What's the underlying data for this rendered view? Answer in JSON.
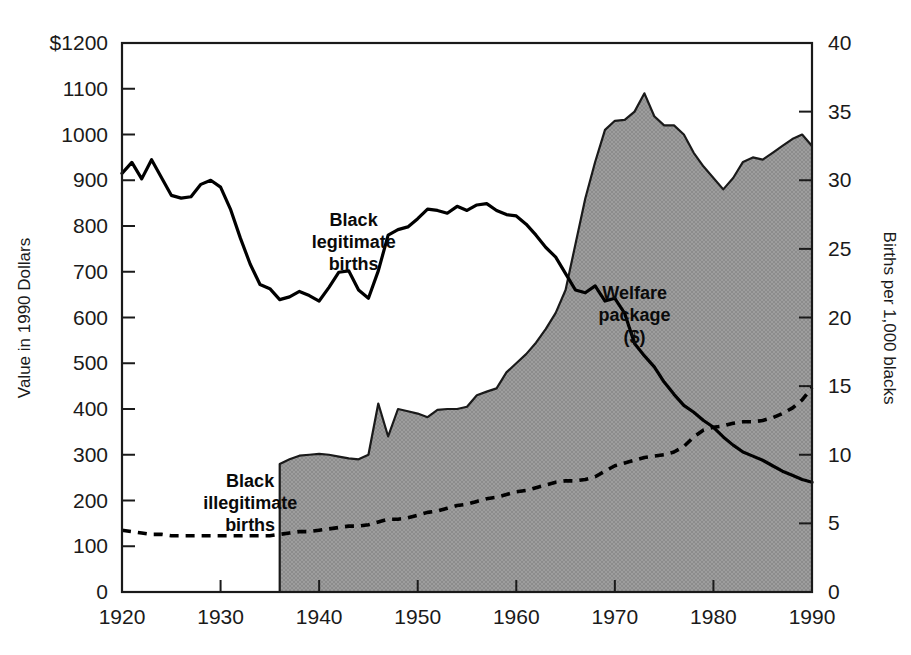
{
  "chart_data": {
    "type": "area",
    "title": "",
    "subtitle": "",
    "xlabel": "",
    "ylabel": "Value in 1990 Dollars",
    "y2label": "Births per 1,000 blacks",
    "xlim": [
      1920,
      1990
    ],
    "ylim": [
      0,
      1200
    ],
    "y2lim": [
      0,
      40
    ],
    "grid": false,
    "legend_position": "inline-annotations",
    "x_ticks": [
      1920,
      1930,
      1940,
      1950,
      1960,
      1970,
      1980,
      1990
    ],
    "x_tick_labels": [
      "1920",
      "1930",
      "1940",
      "1950",
      "1960",
      "1970",
      "1980",
      "1990"
    ],
    "y_ticks": [
      0,
      100,
      200,
      300,
      400,
      500,
      600,
      700,
      800,
      900,
      1000,
      1100,
      1200
    ],
    "y_tick_labels": [
      "0",
      "100",
      "200",
      "300",
      "400",
      "500",
      "600",
      "700",
      "800",
      "900",
      "1000",
      "1100",
      "$1200"
    ],
    "y2_ticks": [
      0,
      5,
      10,
      15,
      20,
      25,
      30,
      35,
      40
    ],
    "y2_tick_labels": [
      "0",
      "5",
      "10",
      "15",
      "20",
      "25",
      "30",
      "35",
      "40"
    ],
    "annotations": [
      {
        "name": "black-legitimate-births",
        "lines": [
          "Black",
          "legitimate",
          "births"
        ],
        "x": 1943.5,
        "y_axis": "left",
        "y": 800
      },
      {
        "name": "black-illegitimate-births",
        "lines": [
          "Black",
          "illegitimate",
          "births"
        ],
        "x": 1933.0,
        "y_axis": "left",
        "y": 230
      },
      {
        "name": "welfare-package",
        "lines": [
          "Welfare",
          "package",
          "($)"
        ],
        "x": 1972.0,
        "y_axis": "left",
        "y": 640
      }
    ],
    "series": [
      {
        "name": "Welfare package ($)",
        "key": "welfare_package",
        "axis": "left",
        "style": "area",
        "fill_color": "#9a9a9a",
        "line_color": "#1a1a1a",
        "x": [
          1936,
          1936,
          1937,
          1938,
          1939,
          1940,
          1941,
          1942,
          1943,
          1944,
          1945,
          1946,
          1947,
          1948,
          1949,
          1950,
          1951,
          1952,
          1953,
          1954,
          1955,
          1956,
          1957,
          1958,
          1959,
          1960,
          1961,
          1962,
          1963,
          1964,
          1965,
          1966,
          1967,
          1968,
          1969,
          1970,
          1971,
          1972,
          1973,
          1974,
          1975,
          1976,
          1977,
          1978,
          1979,
          1980,
          1981,
          1982,
          1983,
          1984,
          1985,
          1986,
          1987,
          1988,
          1989,
          1990
        ],
        "values": [
          0,
          280,
          290,
          298,
          300,
          302,
          300,
          296,
          292,
          290,
          300,
          412,
          340,
          400,
          395,
          390,
          382,
          398,
          400,
          400,
          405,
          430,
          438,
          445,
          480,
          500,
          520,
          545,
          575,
          610,
          660,
          760,
          860,
          940,
          1010,
          1030,
          1032,
          1050,
          1090,
          1040,
          1020,
          1020,
          1000,
          960,
          930,
          905,
          880,
          905,
          940,
          950,
          945,
          960,
          975,
          990,
          1000,
          975
        ]
      },
      {
        "name": "Black legitimate births",
        "key": "black_legitimate_births",
        "axis": "right",
        "style": "solid-line",
        "line_color": "#000000",
        "x": [
          1920,
          1921,
          1922,
          1923,
          1924,
          1925,
          1926,
          1927,
          1928,
          1929,
          1930,
          1931,
          1932,
          1933,
          1934,
          1935,
          1936,
          1937,
          1938,
          1939,
          1940,
          1941,
          1942,
          1943,
          1944,
          1945,
          1946,
          1947,
          1948,
          1949,
          1950,
          1951,
          1952,
          1953,
          1954,
          1955,
          1956,
          1957,
          1958,
          1959,
          1960,
          1961,
          1962,
          1963,
          1964,
          1965,
          1966,
          1967,
          1968,
          1969,
          1970,
          1971,
          1972,
          1973,
          1974,
          1975,
          1976,
          1977,
          1978,
          1979,
          1980,
          1981,
          1982,
          1983,
          1984,
          1985,
          1986,
          1987,
          1988,
          1989,
          1990
        ],
        "values": [
          30.5,
          31.3,
          30.1,
          31.5,
          30.2,
          28.9,
          28.7,
          28.8,
          29.7,
          30.0,
          29.5,
          27.9,
          25.8,
          23.9,
          22.4,
          22.1,
          21.3,
          21.5,
          21.9,
          21.6,
          21.2,
          22.2,
          23.3,
          23.4,
          22.0,
          21.4,
          23.4,
          26.0,
          26.4,
          26.6,
          27.2,
          27.9,
          27.8,
          27.6,
          28.1,
          27.8,
          28.2,
          28.3,
          27.8,
          27.5,
          27.4,
          26.8,
          26.0,
          25.1,
          24.4,
          23.2,
          22.0,
          21.8,
          22.3,
          21.2,
          21.4,
          20.3,
          18.1,
          17.2,
          16.4,
          15.3,
          14.4,
          13.6,
          13.1,
          12.5,
          12.0,
          11.3,
          10.7,
          10.2,
          9.9,
          9.6,
          9.2,
          8.8,
          8.5,
          8.2,
          8.0
        ]
      },
      {
        "name": "Black illegitimate births",
        "key": "black_illegitimate_births",
        "axis": "right",
        "style": "dashed-line",
        "line_color": "#000000",
        "x": [
          1920,
          1921,
          1922,
          1923,
          1924,
          1925,
          1926,
          1927,
          1928,
          1929,
          1930,
          1931,
          1932,
          1933,
          1934,
          1935,
          1936,
          1937,
          1938,
          1939,
          1940,
          1941,
          1942,
          1943,
          1944,
          1945,
          1946,
          1947,
          1948,
          1949,
          1950,
          1951,
          1952,
          1953,
          1954,
          1955,
          1956,
          1957,
          1958,
          1959,
          1960,
          1961,
          1962,
          1963,
          1964,
          1965,
          1966,
          1967,
          1968,
          1969,
          1970,
          1971,
          1972,
          1973,
          1974,
          1975,
          1976,
          1977,
          1978,
          1979,
          1980,
          1981,
          1982,
          1983,
          1984,
          1985,
          1986,
          1987,
          1988,
          1989,
          1990
        ],
        "values": [
          4.5,
          4.4,
          4.3,
          4.2,
          4.2,
          4.1,
          4.1,
          4.1,
          4.1,
          4.1,
          4.1,
          4.1,
          4.1,
          4.1,
          4.1,
          4.1,
          4.2,
          4.3,
          4.4,
          4.4,
          4.5,
          4.6,
          4.7,
          4.8,
          4.8,
          4.9,
          5.1,
          5.3,
          5.3,
          5.4,
          5.6,
          5.8,
          5.9,
          6.1,
          6.3,
          6.4,
          6.6,
          6.8,
          6.9,
          7.1,
          7.3,
          7.4,
          7.6,
          7.8,
          8.0,
          8.1,
          8.1,
          8.2,
          8.4,
          8.8,
          9.2,
          9.4,
          9.6,
          9.8,
          9.9,
          10.0,
          10.2,
          10.6,
          11.3,
          11.8,
          12.0,
          12.1,
          12.3,
          12.4,
          12.4,
          12.5,
          12.7,
          13.0,
          13.4,
          14.0,
          14.9
        ]
      }
    ]
  }
}
